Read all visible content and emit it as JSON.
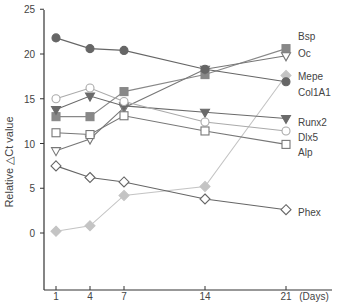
{
  "chart_data": {
    "type": "line",
    "title": "",
    "xlabel": "(Days)",
    "ylabel": "Relative △Ct value",
    "x": [
      1,
      4,
      7,
      14,
      21
    ],
    "x_tick_labels": [
      "1",
      "4",
      "7",
      "14",
      "21"
    ],
    "y_ticks": [
      0,
      5,
      10,
      15,
      20,
      25
    ],
    "ylim": [
      -4,
      25
    ],
    "grid": false,
    "legend_position": "inline-right",
    "series": [
      {
        "name": "Bsp",
        "marker": "square-filled",
        "color": "#888888",
        "values": [
          13.0,
          13.0,
          15.8,
          17.7,
          20.6
        ]
      },
      {
        "name": "Oc",
        "marker": "triangle-down-open",
        "color": "#777777",
        "values": [
          9.2,
          10.5,
          14.0,
          18.3,
          19.8
        ]
      },
      {
        "name": "Mepe",
        "marker": "diamond-filled",
        "color": "#c4c4c4",
        "values": [
          0.2,
          0.8,
          4.2,
          5.2,
          17.6
        ]
      },
      {
        "name": "Col1A1",
        "marker": "circle-filled",
        "color": "#666666",
        "values": [
          21.8,
          20.6,
          20.4,
          18.3,
          16.9
        ]
      },
      {
        "name": "Runx2",
        "marker": "triangle-down-filled",
        "color": "#6a6a6a",
        "values": [
          13.8,
          15.3,
          14.2,
          13.5,
          12.8
        ]
      },
      {
        "name": "Dlx5",
        "marker": "circle-open",
        "color": "#aaaaaa",
        "values": [
          15.0,
          16.2,
          14.7,
          12.4,
          11.4
        ]
      },
      {
        "name": "Alp",
        "marker": "square-open",
        "color": "#777777",
        "values": [
          11.2,
          11.0,
          13.1,
          11.4,
          9.9
        ]
      },
      {
        "name": "Phex",
        "marker": "diamond-open",
        "color": "#666666",
        "values": [
          7.5,
          6.2,
          5.7,
          3.8,
          2.6
        ]
      }
    ],
    "legend_label_y": {
      "Bsp": 36,
      "Oc": 53,
      "Mepe": 76,
      "Col1A1": 92,
      "Runx2": 122,
      "Dlx5": 137,
      "Alp": 152,
      "Phex": 212
    }
  }
}
